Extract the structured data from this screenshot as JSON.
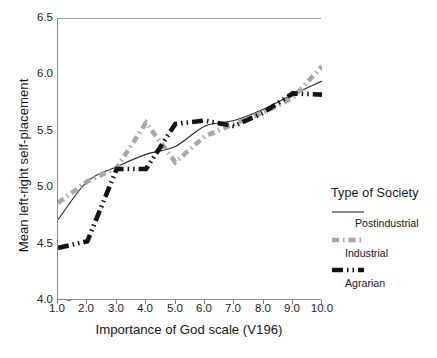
{
  "chart_data": {
    "type": "line",
    "title": "",
    "xlabel": "Importance of God scale (V196)",
    "ylabel": "Mean left-right self-placement",
    "xlim": [
      1.0,
      10.0
    ],
    "ylim": [
      4.0,
      6.5
    ],
    "grid": false,
    "legend_position": "right",
    "legend_title": "Type of Society",
    "x": [
      1.0,
      2.0,
      3.0,
      4.0,
      5.0,
      6.0,
      7.0,
      8.0,
      9.0,
      10.0
    ],
    "xticklabels": [
      "1.0",
      "2.0",
      "3.0",
      "4.0",
      "5.0",
      "6.0",
      "7.0",
      "8.0",
      "9.0",
      "10.0"
    ],
    "yticklabels": [
      "4.0",
      "4.5",
      "5.0",
      "5.5",
      "6.0",
      "6.5"
    ],
    "yticks": [
      4.0,
      4.5,
      5.0,
      5.5,
      6.0,
      6.5
    ],
    "series": [
      {
        "name": "Postindustrial",
        "style": "solid",
        "color": "#2b2b2b",
        "width": 1.1,
        "values": [
          4.72,
          5.06,
          5.19,
          5.3,
          5.37,
          5.55,
          5.6,
          5.7,
          5.83,
          5.95
        ]
      },
      {
        "name": "Industrial",
        "style": "dashed",
        "color": "#a8a8a8",
        "width": 4.6,
        "values": [
          4.87,
          5.06,
          5.18,
          5.58,
          5.23,
          5.46,
          5.57,
          5.67,
          5.8,
          6.08
        ]
      },
      {
        "name": "Agrarian",
        "style": "dash-dot",
        "color": "#141414",
        "width": 4.6,
        "values": [
          4.47,
          4.53,
          5.17,
          5.17,
          5.57,
          5.6,
          5.55,
          5.67,
          5.84,
          5.83
        ]
      }
    ]
  },
  "axes": {
    "x_title": "Importance of God scale (V196)",
    "y_title": "Mean left-right self-placement",
    "x_ticks": [
      "1.0",
      "2.0",
      "3.0",
      "4.0",
      "5.0",
      "6.0",
      "7.0",
      "8.0",
      "9.0",
      "10.0"
    ],
    "y_ticks": [
      "6.5",
      "6.0",
      "5.5",
      "5.0",
      "4.5",
      "4.0"
    ]
  },
  "legend": {
    "title": "Type of Society",
    "entries": [
      {
        "label": "Postindustrial",
        "style": "solid",
        "color": "#2b2b2b"
      },
      {
        "label": "Industrial",
        "style": "dashed",
        "color": "#a8a8a8"
      },
      {
        "label": "Agrarian",
        "style": "dash-dot",
        "color": "#141414"
      }
    ]
  }
}
